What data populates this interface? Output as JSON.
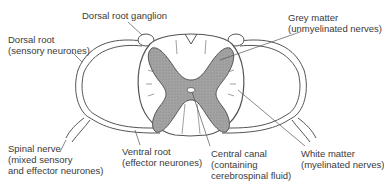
{
  "diagram": {
    "type": "spinal cord cross-section",
    "colors": {
      "grey_matter": "#9a9a9a",
      "outline": "#555555",
      "background": "#ffffff",
      "text": "#3a3a3a"
    },
    "labels": {
      "dorsal_root_ganglion": {
        "line1": "Dorsal root ganglion"
      },
      "dorsal_root": {
        "line1": "Dorsal root",
        "line2": "(sensory neurones)"
      },
      "grey_matter": {
        "line1": "Grey matter",
        "line2": "(unmyelinated nerves)"
      },
      "spinal_nerve": {
        "line1": "Spinal nerve",
        "line2": "(mixed sensory",
        "line3": "and effector neurones)"
      },
      "ventral_root": {
        "line1": "Ventral root",
        "line2": "(effector neurones)"
      },
      "central_canal": {
        "line1": "Central canal",
        "line2": "(containing",
        "line3": "cerebrospinal fluid)"
      },
      "white_matter": {
        "line1": "White matter",
        "line2": "(myelinated nerves)"
      }
    }
  }
}
